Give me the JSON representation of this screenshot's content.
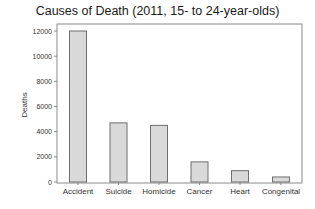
{
  "chart_data": {
    "type": "bar",
    "title": "Causes of Death (2011, 15- to 24-year-olds)",
    "xlabel": "",
    "ylabel": "Deaths",
    "categories": [
      "Accident",
      "Suicide",
      "Homicide",
      "Cancer",
      "Heart",
      "Congenital"
    ],
    "values": [
      12000,
      4700,
      4500,
      1600,
      900,
      400
    ],
    "ylim": [
      0,
      12000
    ],
    "yticks": [
      0,
      2000,
      4000,
      6000,
      8000,
      10000,
      12000
    ],
    "grid": false,
    "legend": null,
    "colors": {
      "bar_fill": "#d9d9d9",
      "bar_stroke": "#6e6e6e",
      "axis": "#8a8a8a",
      "text": "#333333"
    }
  }
}
